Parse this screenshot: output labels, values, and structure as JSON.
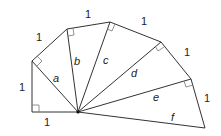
{
  "diagram": {
    "origin": [
      78,
      112
    ],
    "vertices": [
      [
        32,
        112
      ],
      [
        32,
        61
      ],
      [
        67,
        29
      ],
      [
        110,
        22
      ],
      [
        161,
        42
      ],
      [
        191,
        79
      ],
      [
        205,
        128
      ]
    ],
    "outer_edge_labels": [
      "1",
      "1",
      "1",
      "1",
      "1",
      "1",
      "1"
    ],
    "hypotenuse_labels": [
      "a",
      "b",
      "c",
      "d",
      "e",
      "f"
    ],
    "colors": {
      "line": "#333333",
      "right_angle": "#777777",
      "text": "#222222"
    }
  }
}
